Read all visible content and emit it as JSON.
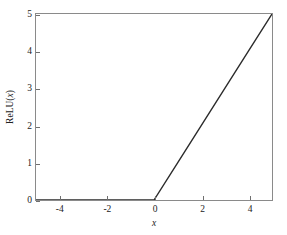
{
  "figure": {
    "background_color": "#ffffff",
    "frame_color": "#8a8a8a",
    "line_color": "#2b2b2b"
  },
  "axes": {
    "xlabel": "x",
    "ylabel_prefix": "ReLU(",
    "ylabel_var": "x",
    "ylabel_suffix": ")",
    "ylabel_full": "ReLU(x)",
    "x_ticks": [
      "-4",
      "-2",
      "0",
      "2",
      "4"
    ],
    "y_ticks": [
      "0",
      "1",
      "2",
      "3",
      "4",
      "5"
    ]
  },
  "chart_data": {
    "type": "line",
    "title": "",
    "subtitle": "",
    "xlabel": "x",
    "ylabel": "ReLU(x)",
    "xlim": [
      -5,
      5
    ],
    "ylim": [
      0,
      5
    ],
    "xticks": [
      -4,
      -2,
      0,
      2,
      4
    ],
    "yticks": [
      0,
      1,
      2,
      3,
      4,
      5
    ],
    "grid": false,
    "legend": null,
    "annotations": [],
    "series": [
      {
        "name": "ReLU(x)",
        "color": "#2b2b2b",
        "linewidth": 1.4,
        "x": [
          -5,
          -4,
          -3,
          -2,
          -1,
          0,
          1,
          2,
          3,
          4,
          5
        ],
        "y": [
          0,
          0,
          0,
          0,
          0,
          0,
          1,
          2,
          3,
          4,
          5
        ]
      }
    ]
  }
}
